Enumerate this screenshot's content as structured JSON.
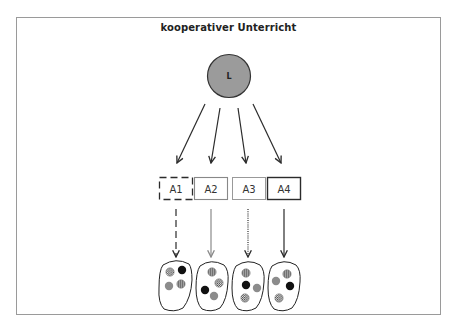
{
  "diagram": {
    "title": "kooperativer Unterricht",
    "teacher": {
      "label": "L",
      "fill": "#9b9b9b",
      "stroke": "#333333"
    },
    "tasks": [
      {
        "label": "A1",
        "border_style": "dashed"
      },
      {
        "label": "A2",
        "border_style": "solid-gray"
      },
      {
        "label": "A3",
        "border_style": "dotted"
      },
      {
        "label": "A4",
        "border_style": "solid-dark"
      }
    ],
    "groups": [
      {
        "task": "A1",
        "members": [
          "hatched",
          "black",
          "gray",
          "striped"
        ]
      },
      {
        "task": "A2",
        "members": [
          "striped",
          "hatched",
          "black",
          "gray"
        ]
      },
      {
        "task": "A3",
        "members": [
          "striped",
          "black",
          "gray",
          "hatched"
        ]
      },
      {
        "task": "A4",
        "members": [
          "striped",
          "gray",
          "black",
          "hatched"
        ]
      }
    ],
    "colors": {
      "frame": "#9a9a9a",
      "arrow_dark": "#2b2b2b",
      "arrow_gray": "#8a8a8a",
      "member_gray": "#8c8c8c",
      "member_black": "#111111"
    }
  }
}
